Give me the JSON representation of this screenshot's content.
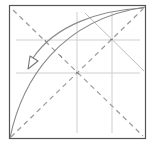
{
  "diagram": {
    "title": "Origami fold step",
    "type": "origami-folding-diagram",
    "colors": {
      "background": "#ffffff",
      "paper_edge": "#555555",
      "valley_crease": "#9a9a9a",
      "reference_crease": "#cfcfcf",
      "curve": "#8a8a8a",
      "arrow": "#8a8a8a"
    },
    "paper": {
      "x": 9,
      "y": 5,
      "width": 137,
      "height": 134
    },
    "elements": {
      "valley_fold_diagonal_1": "dashed diagonal top-left to bottom-right",
      "valley_fold_diagonal_2": "dashed diagonal bottom-left to top-right",
      "reference_crease_h1": "horizontal crease upper",
      "reference_crease_h2": "horizontal crease lower",
      "reference_crease_v1": "vertical crease left",
      "reference_crease_v2": "vertical crease right",
      "crease_short_diagonal": "short diagonal crease top-right",
      "fold_edge_curve": "curved fold edge bottom-left to top-right",
      "fold_arrow": "curved fold arrow pointing down-left"
    }
  }
}
